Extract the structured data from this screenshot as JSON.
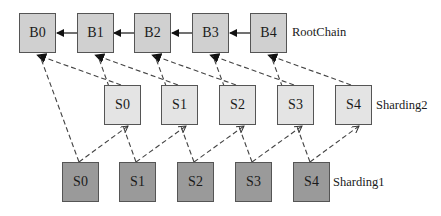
{
  "diagram": {
    "rows": {
      "root_chain": {
        "label": "RootChain",
        "nodes": [
          "B0",
          "B1",
          "B2",
          "B3",
          "B4"
        ],
        "fill": "#d0d0d0"
      },
      "sharding2": {
        "label": "Sharding2",
        "nodes": [
          "S0",
          "S1",
          "S2",
          "S3",
          "S4"
        ],
        "fill": "#e4e4e4"
      },
      "sharding1": {
        "label": "Sharding1",
        "nodes": [
          "S0",
          "S1",
          "S2",
          "S3",
          "S4"
        ],
        "fill": "#9a9a9a"
      }
    },
    "edges": {
      "root_chain_links": "solid arrows from B(i+1) to B(i)",
      "cross_links": "dashed arrows between shard blocks and root blocks"
    }
  }
}
